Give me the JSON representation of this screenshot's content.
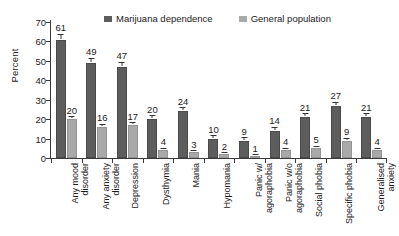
{
  "chart_data": {
    "type": "bar",
    "title": "",
    "xlabel": "",
    "ylabel": "Percent",
    "ylim": [
      0,
      70
    ],
    "yticks": [
      0,
      10,
      20,
      30,
      40,
      50,
      60,
      70
    ],
    "grid": false,
    "legend_position": "top",
    "categories": [
      "Any mood disorder",
      "Any anxiety disorder",
      "Depression",
      "Dysthymia",
      "Mania",
      "Hypomania",
      "Panic w/ agoraphobia",
      "Panic w/o agoraphobia",
      "Social phobia",
      "Specific phobia",
      "Generalised anxiety"
    ],
    "category_lines": [
      [
        "Any mood",
        "disorder"
      ],
      [
        "Any anxiety",
        "disorder"
      ],
      [
        "Depression"
      ],
      [
        "Dysthymia"
      ],
      [
        "Mania"
      ],
      [
        "Hypomania"
      ],
      [
        "Panic w/",
        "agoraphobia"
      ],
      [
        "Panic w/o",
        "agoraphobia"
      ],
      [
        "Social phobia"
      ],
      [
        "Specific phobia"
      ],
      [
        "Generalised",
        "anxiety"
      ]
    ],
    "series": [
      {
        "name": "Marijuana dependence",
        "color": "#5d5d5d",
        "values": [
          61,
          49,
          47,
          20,
          24,
          10,
          9,
          14,
          21,
          27,
          21
        ],
        "errors": [
          2.5,
          2.0,
          2.0,
          1.5,
          1.5,
          1.2,
          1.2,
          1.5,
          1.5,
          1.5,
          1.5
        ]
      },
      {
        "name": "General population",
        "color": "#a9a9a9",
        "values": [
          20,
          16,
          17,
          4,
          3,
          2,
          1,
          4,
          5,
          9,
          4
        ],
        "errors": [
          1.0,
          1.0,
          1.0,
          0.8,
          0.6,
          0.5,
          0.4,
          0.8,
          0.8,
          0.8,
          0.8
        ]
      }
    ]
  }
}
